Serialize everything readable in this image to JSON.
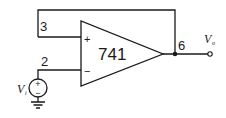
{
  "diagram": {
    "type": "op-amp circuit",
    "opamp": {
      "label": "741",
      "noninverting_symbol": "+",
      "inverting_symbol": "−"
    },
    "pins": {
      "noninverting": "3",
      "inverting": "2",
      "output": "6"
    },
    "source": {
      "label_main": "V",
      "label_sub": "i",
      "plus": "+",
      "minus": "−"
    },
    "output": {
      "label_main": "V",
      "label_sub": "o"
    }
  }
}
